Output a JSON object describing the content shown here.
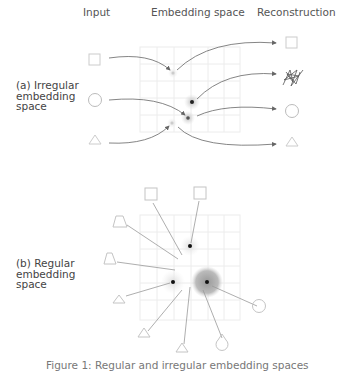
{
  "headers": {
    "input": "Input",
    "embedding": "Embedding space",
    "reconstruction": "Reconstruction"
  },
  "panels": {
    "irregular": {
      "label": "(a) Irregular\nembedding\nspace",
      "inputs": [
        "square",
        "circle",
        "triangle"
      ],
      "reconstructions": [
        "square",
        "scribble",
        "circle",
        "triangle"
      ]
    },
    "regular": {
      "label": "(b) Regular\nembedding\nspace",
      "inputs": [
        "square",
        "square",
        "trapezoid",
        "trapezoid",
        "triangle",
        "triangle",
        "triangle",
        "circle",
        "circle"
      ]
    }
  },
  "caption": "Figure 1: Regular and irregular embedding spaces",
  "colors": {
    "grid": "#e6e6e6",
    "arrow": "#666666",
    "shape": "#bbbbbb",
    "point": "#222222"
  }
}
